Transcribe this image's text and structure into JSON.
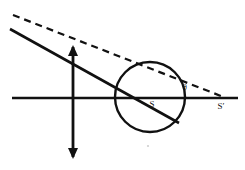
{
  "figure": {
    "background_color": "#ffffff",
    "ink_color": "#111111",
    "width": 245,
    "height": 170
  },
  "labels": {
    "vertex_s": "S",
    "vertex_s_prime": "Sʹ",
    "angle_theta": "θ"
  },
  "elements": {
    "optical_axis": {
      "name": "optical-axis",
      "x1": 12,
      "y1": 98,
      "x2": 238,
      "y2": 98,
      "stroke_width": 2.4
    },
    "object_arrow": {
      "name": "object-arrow",
      "x": 73,
      "y_top": 47,
      "y_bottom": 157,
      "stroke_width": 2.8,
      "head_length": 11,
      "head_half_width": 5
    },
    "sphere": {
      "name": "refracting-sphere",
      "cx": 150,
      "cy": 97,
      "r": 35,
      "stroke_width": 2.4
    },
    "solid_ray": {
      "name": "solid-ray",
      "x1": 10,
      "y1": 29,
      "x2": 179,
      "y2": 123,
      "stroke_width": 2.6
    },
    "dashed_ray": {
      "name": "dashed-ray",
      "x1": 13,
      "y1": 15,
      "x2": 221,
      "y2": 96,
      "stroke_width": 2.2,
      "dash_pattern": "7 5"
    },
    "label_positions": {
      "s_x": 152,
      "s_y": 107,
      "s_prime_x": 221,
      "s_prime_y": 109,
      "theta_x": 185,
      "theta_y": 90
    },
    "speck": {
      "name": "page-speck",
      "cx": 148,
      "cy": 146,
      "r": 1.1
    }
  }
}
